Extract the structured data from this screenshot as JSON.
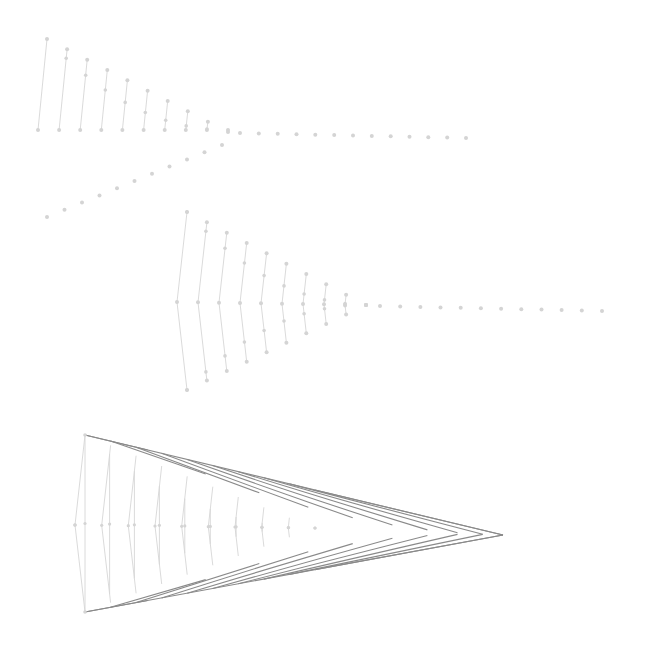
{
  "diagram": {
    "type": "string-art-bezier-construction",
    "colors": {
      "background": "#ffffff",
      "point": "#d4d4d4",
      "light_line": "#d6d6d6",
      "dark_line": "#8a8a8a"
    },
    "stages": [
      {
        "id": "stage-1",
        "description": "Two-arm quadratic envelope with dotted extensions",
        "arms": [
          {
            "from": [
              47,
              39
            ],
            "to": [
              228,
              132
            ],
            "points": 10
          },
          {
            "from": [
              38,
              130
            ],
            "to": [
              228,
              130
            ],
            "points": 10
          }
        ],
        "vertex": [
          228,
          131
        ],
        "dotted_rows": [
          {
            "from": [
              240,
              133
            ],
            "to": [
              466,
              138
            ],
            "points": 13
          },
          {
            "from": [
              47,
              217
            ],
            "to": [
              222,
              145
            ],
            "points": 11
          }
        ]
      },
      {
        "id": "stage-2",
        "description": "Three-arm envelope forming two mirrored curves with dotted extension",
        "arms": [
          {
            "from": [
              187,
              212
            ],
            "to": [
              366,
              305
            ],
            "points": 10
          },
          {
            "from": [
              177,
              302
            ],
            "to": [
              366,
              305
            ],
            "points": 10
          },
          {
            "from": [
              187,
              390
            ],
            "to": [
              366,
              305
            ],
            "points": 10
          }
        ],
        "dotted_rows": [
          {
            "from": [
              380,
              306
            ],
            "to": [
              602,
              311
            ],
            "points": 12
          }
        ]
      },
      {
        "id": "stage-3",
        "description": "Full envelope with inner light strings and outer dark strings converging to tip",
        "arms": [
          {
            "from": [
              85,
              435
            ],
            "to": [
              315,
              528
            ],
            "points": 10
          },
          {
            "from": [
              75,
              525
            ],
            "to": [
              315,
              528
            ],
            "points": 10
          },
          {
            "from": [
              85,
              612
            ],
            "to": [
              315,
              528
            ],
            "points": 10
          }
        ],
        "tip": [
          503,
          535
        ],
        "dark_strings": 10
      }
    ]
  }
}
